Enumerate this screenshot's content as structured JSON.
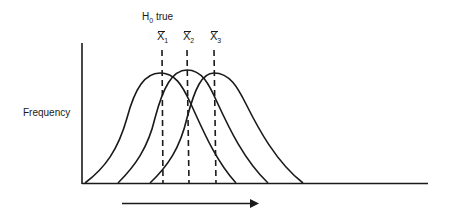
{
  "diagram": {
    "title": "H0 true",
    "title_main": "H",
    "title_sub": "0",
    "title_rest": " true",
    "y_axis_label": "Frequency",
    "means": [
      {
        "symbol": "X",
        "subscript": "1",
        "x": 163
      },
      {
        "symbol": "X",
        "subscript": "2",
        "x": 190
      },
      {
        "symbol": "X",
        "subscript": "3",
        "x": 216
      }
    ],
    "curves": [
      {
        "name": "distribution-1",
        "start": 85,
        "peak_x": 160,
        "peak_y": 73,
        "end": 236
      },
      {
        "name": "distribution-2",
        "start": 118,
        "peak_x": 187,
        "peak_y": 70,
        "end": 268
      },
      {
        "name": "distribution-3",
        "start": 150,
        "peak_x": 214,
        "peak_y": 73,
        "end": 303
      }
    ],
    "arrow": {
      "direction": "right",
      "x1": 122,
      "x2": 258,
      "y": 203
    },
    "colors": {
      "ink": "#1a1a1a",
      "background": "#ffffff"
    }
  }
}
